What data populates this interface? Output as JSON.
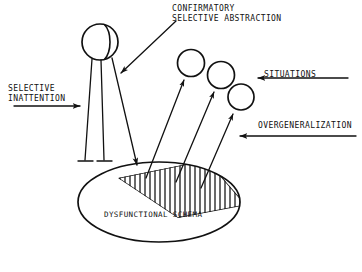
{
  "figure": {
    "background_color": "#ffffff",
    "ink_color": "#111111",
    "width": 362,
    "height": 272
  },
  "labels": {
    "selective_inattention": {
      "line1": "SELECTIVE",
      "line2": "INATTENTION"
    },
    "confirmatory_selective_abstraction": {
      "line1": "CONFIRMATORY",
      "line2": "SELECTIVE ABSTRACTION"
    },
    "situations": "SITUATIONS",
    "overgeneralization": "OVERGENERALIZATION",
    "dysfunctional_schema": "DYSFUNCTIONAL SCHEMA"
  },
  "shapes": {
    "filter_circle": {
      "name": "selective-inattention-filter",
      "cx": 100,
      "cy": 42,
      "r": 18
    },
    "situation_circles": [
      {
        "name": "situation-circle-1",
        "cx": 191,
        "cy": 63,
        "r": 13.5
      },
      {
        "name": "situation-circle-2",
        "cx": 221,
        "cy": 75,
        "r": 13.5
      },
      {
        "name": "situation-circle-3",
        "cx": 241,
        "cy": 97,
        "r": 13.0
      }
    ],
    "schema_ellipse": {
      "name": "dysfunctional-schema-ellipse",
      "cx": 159,
      "cy": 202,
      "rx": 81,
      "ry": 40
    },
    "hatched_band": {
      "name": "hatched-band",
      "hatch_count": 25,
      "hatch_direction": "vertical"
    }
  },
  "arrows": {
    "selective_inattention_arrow": {
      "x1": 14,
      "y1": 106,
      "x2": 82,
      "y2": 106,
      "direction": "right"
    },
    "situations_arrow": {
      "x1": 348,
      "y1": 78,
      "x2": 256,
      "y2": 78,
      "direction": "left"
    },
    "overgeneralization_arrow": {
      "x1": 356,
      "y1": 136,
      "x2": 238,
      "y2": 136,
      "direction": "left"
    },
    "confirmatory_arrow": {
      "x1": 176,
      "y1": 21,
      "x2": 121,
      "y2": 73,
      "direction": "down-left"
    },
    "blocked_paths": 2,
    "passing_paths": 1,
    "upward_schema_arrows": 3
  }
}
